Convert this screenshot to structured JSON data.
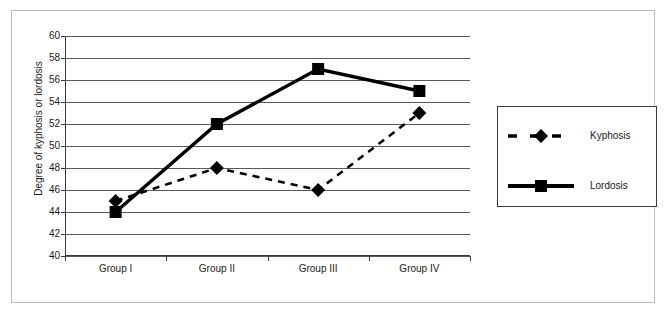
{
  "chart_data": {
    "type": "line",
    "title": "",
    "xlabel": "",
    "ylabel": "Degree of kyphosis or lordosis",
    "categories": [
      "Group I",
      "Group II",
      "Group III",
      "Group IV"
    ],
    "ylim": [
      40,
      60
    ],
    "yticks": [
      40,
      42,
      44,
      46,
      48,
      50,
      52,
      54,
      56,
      58,
      60
    ],
    "grid": true,
    "legend_position": "right",
    "series": [
      {
        "name": "Kyphosis",
        "values": [
          45,
          48,
          46,
          53
        ],
        "marker": "diamond",
        "linestyle": "dashed",
        "color": "#000000"
      },
      {
        "name": "Lordosis",
        "values": [
          44,
          52,
          57,
          55
        ],
        "marker": "square",
        "linestyle": "solid",
        "color": "#000000"
      }
    ]
  },
  "legend": {
    "items": [
      {
        "label": "Kyphosis",
        "marker": "diamond-marker-icon",
        "style": "dashed"
      },
      {
        "label": "Lordosis",
        "marker": "square-marker-icon",
        "style": "solid"
      }
    ]
  }
}
